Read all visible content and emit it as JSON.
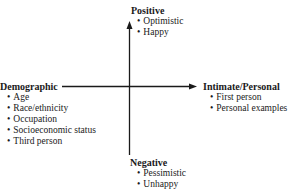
{
  "diagram": {
    "axes": {
      "vertical": {
        "top_label": "Positive",
        "bottom_label": "Negative"
      },
      "horizontal": {
        "left_label": "Demographic",
        "right_label": "Intimate/Personal"
      }
    },
    "positive": {
      "title": "Positive",
      "items": [
        "Optimistic",
        "Happy"
      ]
    },
    "negative": {
      "title": "Negative",
      "items": [
        "Pessimistic",
        "Unhappy"
      ]
    },
    "demographic": {
      "title": "Demographic",
      "items": [
        "Age",
        "Race/ethnicity",
        "Occupation",
        "Socioeconomic status",
        "Third person"
      ]
    },
    "intimate": {
      "title": "Intimate/Personal",
      "items": [
        "First person",
        "Personal examples"
      ]
    },
    "colors": {
      "line": "#1a1a1a",
      "text": "#1a1a1a",
      "background": "#ffffff"
    }
  }
}
